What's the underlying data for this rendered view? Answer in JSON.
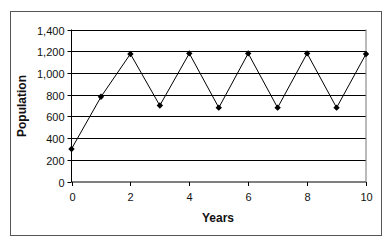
{
  "chart_data": {
    "type": "line",
    "title": "",
    "xlabel": "Years",
    "ylabel": "Population",
    "x": [
      0,
      1,
      2,
      3,
      4,
      5,
      6,
      7,
      8,
      9,
      10
    ],
    "series": [
      {
        "name": "Population",
        "values": [
          300,
          780,
          1175,
          700,
          1180,
          680,
          1180,
          680,
          1180,
          680,
          1175
        ],
        "marker": "diamond",
        "color": "#000000"
      }
    ],
    "xlim": [
      0,
      10
    ],
    "ylim": [
      0,
      1400
    ],
    "x_ticks": [
      0,
      2,
      4,
      6,
      8,
      10
    ],
    "x_tick_labels": [
      "0",
      "2",
      "4",
      "6",
      "8",
      "10"
    ],
    "y_ticks": [
      0,
      200,
      400,
      600,
      800,
      1000,
      1200,
      1400
    ],
    "y_tick_labels": [
      "0",
      "200",
      "400",
      "600",
      "800",
      "1,000",
      "1,200",
      "1,400"
    ],
    "grid": {
      "horizontal": true,
      "vertical": false
    },
    "legend": "none"
  },
  "labels": {
    "xlabel": "Years",
    "ylabel": "Population"
  },
  "colors": {
    "line": "#000000",
    "gridline": "#000000",
    "frame": "#555555",
    "background": "#ffffff"
  }
}
